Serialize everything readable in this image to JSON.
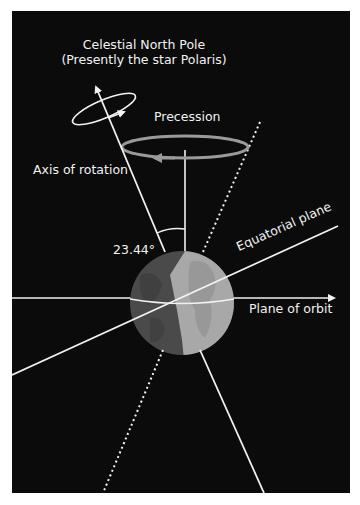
{
  "diagram": {
    "labels": {
      "pole_line1": "Celestial North Pole",
      "pole_line2": "(Presently the star Polaris)",
      "precession": "Precession",
      "axis": "Axis of rotation",
      "angle": "23.44°",
      "equatorial": "Equatorial plane",
      "orbit": "Plane of orbit"
    },
    "colors": {
      "background": "#0b0b0b",
      "line": "#f2f2f2",
      "precession_ring": "#9a9a9a",
      "globe_dark": "#4a4a4a",
      "globe_light": "#a8a8a8"
    },
    "icons": {
      "rotation_arrow": "arrow-icon",
      "precession_arrow": "arrow-icon",
      "orbit_arrow": "arrow-icon"
    }
  }
}
